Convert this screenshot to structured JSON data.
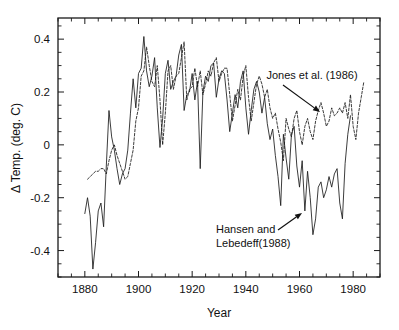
{
  "chart_data": {
    "type": "line",
    "title": "",
    "xlabel": "Year",
    "ylabel": "Δ Temp. (deg. C)",
    "xlim": [
      1870,
      1990
    ],
    "ylim": [
      -0.5,
      0.48
    ],
    "xticks": [
      1880,
      1900,
      1920,
      1940,
      1960,
      1980
    ],
    "xtick_labels": [
      "1880",
      "1900",
      "1920",
      "1940",
      "1960",
      "1980"
    ],
    "xtick_minor_step": 5,
    "yticks": [
      -0.4,
      -0.2,
      0,
      0.2,
      0.4
    ],
    "ytick_labels": [
      "-0.4",
      "-0.2",
      "0",
      "0.2",
      "0.4"
    ],
    "ytick_minor_step": 0.05,
    "grid": false,
    "legend_position": "inline-annotations",
    "frame": "box",
    "series": [
      {
        "name": "Jones et al. (1986)",
        "style": "dashed",
        "color": "#1a1a1a",
        "x_start": 1881,
        "values": [
          -0.13,
          -0.12,
          -0.11,
          -0.1,
          -0.1,
          -0.09,
          -0.09,
          -0.11,
          -0.06,
          -0.02,
          0.0,
          -0.04,
          -0.07,
          -0.1,
          -0.13,
          -0.12,
          -0.07,
          -0.02,
          0.09,
          0.14,
          0.26,
          0.28,
          0.37,
          0.3,
          0.24,
          0.22,
          0.3,
          0.17,
          0.0,
          0.12,
          0.28,
          0.3,
          0.21,
          0.26,
          0.27,
          0.33,
          0.39,
          0.17,
          0.21,
          0.22,
          0.29,
          0.22,
          0.28,
          0.19,
          0.23,
          0.28,
          0.26,
          0.31,
          0.33,
          0.24,
          0.27,
          0.29,
          0.29,
          0.19,
          0.09,
          0.15,
          0.21,
          0.17,
          0.26,
          0.3,
          0.18,
          0.09,
          0.16,
          0.23,
          0.26,
          0.23,
          0.18,
          0.21,
          0.14,
          0.1,
          0.12,
          0.06,
          0.01,
          -0.06,
          0.1,
          0.06,
          0.03,
          0.1,
          0.13,
          0.05,
          0.0,
          0.07,
          0.1,
          0.05,
          0.02,
          0.09,
          0.13,
          0.16,
          0.12,
          0.07,
          0.09,
          0.14,
          0.11,
          0.12,
          0.14,
          0.12,
          0.16,
          0.1,
          0.19,
          0.07,
          0.02,
          0.12,
          0.18,
          0.24
        ]
      },
      {
        "name": "Hansen and Lebedeff (1988)",
        "style": "solid",
        "color": "#1a1a1a",
        "x_start": 1880,
        "values": [
          -0.26,
          -0.2,
          -0.27,
          -0.47,
          -0.37,
          -0.25,
          -0.22,
          -0.31,
          -0.08,
          0.13,
          0.03,
          -0.02,
          -0.09,
          -0.15,
          -0.11,
          -0.09,
          -0.02,
          0.12,
          0.25,
          0.14,
          0.27,
          0.29,
          0.41,
          0.28,
          0.22,
          0.26,
          0.33,
          0.14,
          -0.01,
          0.1,
          0.27,
          0.32,
          0.21,
          0.24,
          0.26,
          0.34,
          0.38,
          0.13,
          0.19,
          0.2,
          0.27,
          0.17,
          0.24,
          -0.09,
          0.2,
          0.26,
          0.24,
          0.3,
          0.31,
          0.18,
          0.25,
          0.28,
          0.27,
          0.17,
          0.05,
          0.12,
          0.19,
          0.14,
          0.24,
          0.28,
          0.14,
          0.04,
          0.13,
          0.21,
          0.24,
          0.2,
          0.12,
          0.18,
          0.08,
          0.02,
          0.06,
          -0.04,
          -0.12,
          -0.23,
          0.04,
          -0.05,
          -0.13,
          0.04,
          0.07,
          -0.08,
          -0.16,
          -0.06,
          -0.25,
          -0.1,
          -0.2,
          -0.34,
          -0.28,
          -0.16,
          -0.14,
          -0.2,
          -0.17,
          -0.12,
          -0.16,
          -0.11,
          -0.09,
          -0.22,
          -0.28,
          -0.07,
          0.04,
          0.11
        ]
      }
    ],
    "annotations": [
      {
        "id": "jones-annotation",
        "lines": [
          "Jones et al. (1986)"
        ],
        "text_x": 312,
        "text_y": 79,
        "arrow_from_x": 283,
        "arrow_from_y": 85,
        "arrow_to_x": 320,
        "arrow_to_y": 112
      },
      {
        "id": "hansen-annotation",
        "lines": [
          "Hansen and",
          "Lebedeff(1988)"
        ],
        "text_x": 216,
        "text_y": 233,
        "arrow_from_x": 278,
        "arrow_from_y": 230,
        "arrow_to_x": 302,
        "arrow_to_y": 213
      }
    ]
  }
}
